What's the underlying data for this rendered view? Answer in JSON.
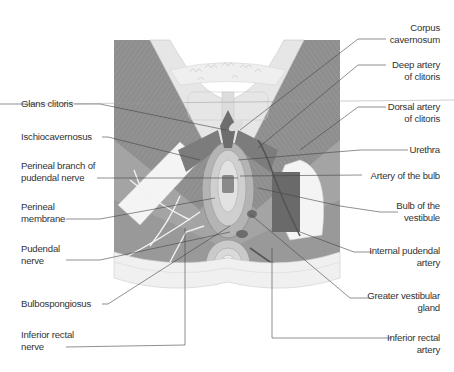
{
  "figure": {
    "colors": {
      "muscle_dark": "#8a8a8a",
      "muscle_mid": "#a8a8a8",
      "skin_light": "#e4e4e4",
      "fat_light": "#ededed",
      "leader": "#444444",
      "text": "#333333"
    },
    "labels_left": [
      {
        "id": "glans-clitoris",
        "lines": [
          "Glans clitoris"
        ]
      },
      {
        "id": "ischiocavernosus",
        "lines": [
          "Ischiocavernosus"
        ]
      },
      {
        "id": "perineal-branch-of-pudendal-nerve",
        "lines": [
          "Perineal branch of",
          "pudendal nerve"
        ]
      },
      {
        "id": "perineal-membrane",
        "lines": [
          "Perineal",
          "membrane"
        ]
      },
      {
        "id": "pudendal-nerve",
        "lines": [
          "Pudendal",
          "nerve"
        ]
      },
      {
        "id": "bulbospongiosus",
        "lines": [
          "Bulbospongiosus"
        ]
      },
      {
        "id": "inferior-rectal-nerve",
        "lines": [
          "Inferior rectal",
          "nerve"
        ]
      }
    ],
    "labels_right": [
      {
        "id": "corpus-cavernosum",
        "lines": [
          "Corpus",
          "cavernosum"
        ]
      },
      {
        "id": "deep-artery-of-clitoris",
        "lines": [
          "Deep artery",
          "of clitoris"
        ]
      },
      {
        "id": "dorsal-artery-of-clitoris",
        "lines": [
          "Dorsal artery",
          "of clitoris"
        ]
      },
      {
        "id": "urethra",
        "lines": [
          "Urethra"
        ]
      },
      {
        "id": "artery-of-the-bulb",
        "lines": [
          "Artery of the bulb"
        ]
      },
      {
        "id": "bulb-of-the-vestibule",
        "lines": [
          "Bulb of the",
          "vestibule"
        ]
      },
      {
        "id": "internal-pudendal-artery",
        "lines": [
          "Internal pudendal",
          "artery"
        ]
      },
      {
        "id": "greater-vestibular-gland",
        "lines": [
          "Greater vestibular",
          "gland"
        ]
      },
      {
        "id": "inferior-rectal-artery",
        "lines": [
          "Inferior rectal",
          "artery"
        ]
      }
    ]
  }
}
